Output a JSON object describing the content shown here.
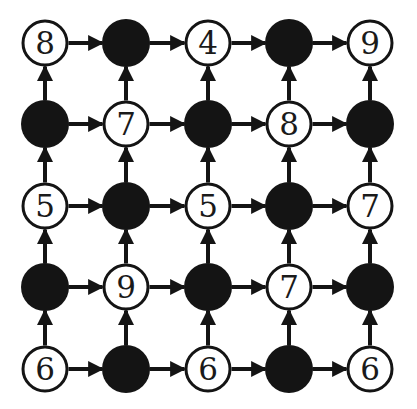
{
  "diagram": {
    "type": "grid-graph",
    "rows": 5,
    "cols": 5,
    "colors": {
      "ink": "#141414",
      "background": "#ffffff"
    },
    "col_x": [
      45,
      126,
      208,
      289,
      370
    ],
    "row_y": [
      43,
      124,
      206,
      287,
      369
    ],
    "edge_direction": {
      "horizontal": "right",
      "vertical": "up"
    },
    "nodes": [
      [
        {
          "type": "open",
          "label": "8"
        },
        {
          "type": "filled",
          "label": ""
        },
        {
          "type": "open",
          "label": "4"
        },
        {
          "type": "filled",
          "label": ""
        },
        {
          "type": "open",
          "label": "9"
        }
      ],
      [
        {
          "type": "filled",
          "label": ""
        },
        {
          "type": "open",
          "label": "7"
        },
        {
          "type": "filled",
          "label": ""
        },
        {
          "type": "open",
          "label": "8"
        },
        {
          "type": "filled",
          "label": ""
        }
      ],
      [
        {
          "type": "open",
          "label": "5"
        },
        {
          "type": "filled",
          "label": ""
        },
        {
          "type": "open",
          "label": "5"
        },
        {
          "type": "filled",
          "label": ""
        },
        {
          "type": "open",
          "label": "7"
        }
      ],
      [
        {
          "type": "filled",
          "label": ""
        },
        {
          "type": "open",
          "label": "9"
        },
        {
          "type": "filled",
          "label": ""
        },
        {
          "type": "open",
          "label": "7"
        },
        {
          "type": "filled",
          "label": ""
        }
      ],
      [
        {
          "type": "open",
          "label": "6"
        },
        {
          "type": "filled",
          "label": ""
        },
        {
          "type": "open",
          "label": "6"
        },
        {
          "type": "filled",
          "label": ""
        },
        {
          "type": "open",
          "label": "6"
        }
      ]
    ]
  }
}
